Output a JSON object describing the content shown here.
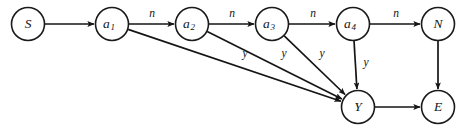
{
  "diagram": {
    "canvas": {
      "width": 473,
      "height": 134,
      "background": "#ffffff"
    },
    "style": {
      "stroke": "#151515",
      "node_fill": "#ffffff",
      "node_radius": 16.5
    },
    "nodes": [
      {
        "id": "S",
        "label": "S",
        "sub": "",
        "cx": 28,
        "cy": 24
      },
      {
        "id": "a1",
        "label": "a",
        "sub": "1",
        "cx": 112,
        "cy": 24
      },
      {
        "id": "a2",
        "label": "a",
        "sub": "2",
        "cx": 192,
        "cy": 24
      },
      {
        "id": "a3",
        "label": "a",
        "sub": "3",
        "cx": 272,
        "cy": 24
      },
      {
        "id": "a4",
        "label": "a",
        "sub": "4",
        "cx": 353,
        "cy": 24
      },
      {
        "id": "N",
        "label": "N",
        "sub": "",
        "cx": 438,
        "cy": 24
      },
      {
        "id": "Y",
        "label": "Y",
        "sub": "",
        "cx": 358,
        "cy": 107
      },
      {
        "id": "E",
        "label": "E",
        "sub": "",
        "cx": 438,
        "cy": 107
      }
    ],
    "edges": [
      {
        "id": "S-a1",
        "from": "S",
        "to": "a1",
        "label": "",
        "label_x": 0,
        "label_y": 0
      },
      {
        "id": "a1-a2",
        "from": "a1",
        "to": "a2",
        "label": "n",
        "label_x": 152,
        "label_y": 14
      },
      {
        "id": "a2-a3",
        "from": "a2",
        "to": "a3",
        "label": "n",
        "label_x": 232,
        "label_y": 14
      },
      {
        "id": "a3-a4",
        "from": "a3",
        "to": "a4",
        "label": "n",
        "label_x": 313,
        "label_y": 14
      },
      {
        "id": "a4-N",
        "from": "a4",
        "to": "N",
        "label": "n",
        "label_x": 396,
        "label_y": 14
      },
      {
        "id": "a1-Y",
        "from": "a1",
        "to": "Y",
        "label": "y",
        "label_x": 245,
        "label_y": 54
      },
      {
        "id": "a2-Y",
        "from": "a2",
        "to": "Y",
        "label": "y",
        "label_x": 284,
        "label_y": 54
      },
      {
        "id": "a3-Y",
        "from": "a3",
        "to": "Y",
        "label": "y",
        "label_x": 322,
        "label_y": 54
      },
      {
        "id": "a4-Y",
        "from": "a4",
        "to": "Y",
        "label": "y",
        "label_x": 366,
        "label_y": 63
      },
      {
        "id": "N-E",
        "from": "N",
        "to": "E",
        "label": "",
        "label_x": 0,
        "label_y": 0
      },
      {
        "id": "Y-E",
        "from": "Y",
        "to": "E",
        "label": "",
        "label_x": 0,
        "label_y": 0
      }
    ]
  }
}
